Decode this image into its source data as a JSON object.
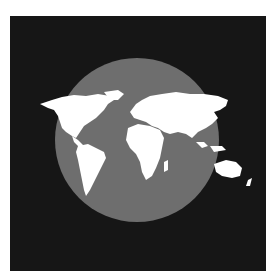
{
  "image": {
    "subject": "world map silhouette over a globe",
    "colors": {
      "background": "#ffffff",
      "panel": "#161616",
      "globe": "#6e6e6e",
      "land": "#ffffff"
    }
  }
}
